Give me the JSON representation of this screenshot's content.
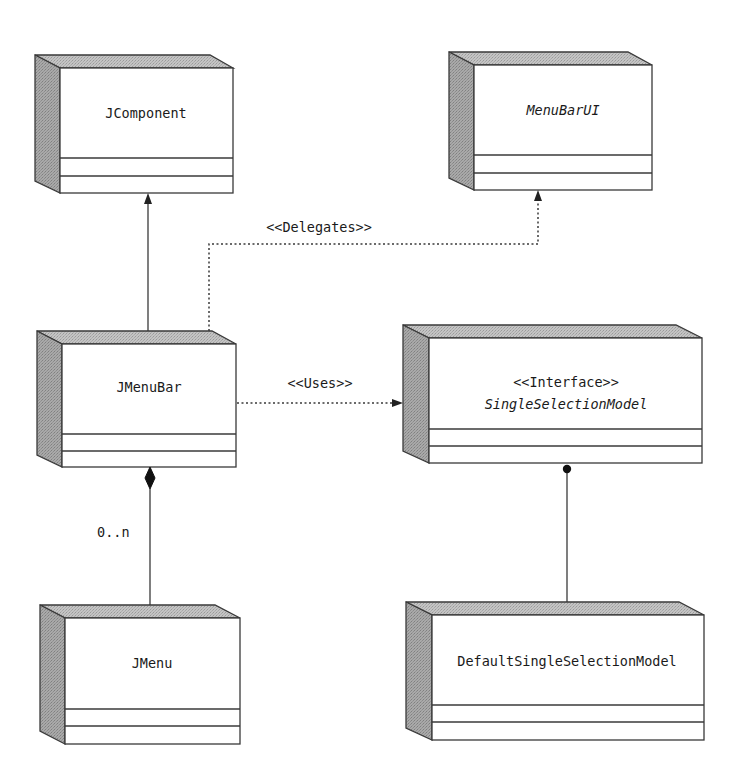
{
  "diagram": {
    "type": "UML class diagram",
    "colors": {
      "stroke": "#3a3a3a",
      "front_face": "#ffffff",
      "side_face": "#b8b8b8",
      "top_face": "#c8c8c8",
      "text": "#1a1a1a"
    },
    "classes": {
      "jcomponent": {
        "name": "JComponent",
        "italic": false
      },
      "menubarui": {
        "name": "MenuBarUI",
        "italic": true
      },
      "jmenubar": {
        "name": "JMenuBar",
        "italic": false
      },
      "singleselectionmodel": {
        "stereotype": "<<Interface>>",
        "name": "SingleSelectionModel",
        "italic": true
      },
      "jmenu": {
        "name": "JMenu",
        "italic": false
      },
      "defaultsingleselectionmodel": {
        "name": "DefaultSingleSelectionModel",
        "italic": false
      }
    },
    "relations": {
      "inherits": {
        "from": "JMenuBar",
        "to": "JComponent",
        "style": "solid-arrow"
      },
      "delegates": {
        "label": "<<Delegates>>",
        "from": "JMenuBar",
        "to": "MenuBarUI",
        "style": "dotted-arrow"
      },
      "uses": {
        "label": "<<Uses>>",
        "from": "JMenuBar",
        "to": "SingleSelectionModel",
        "style": "dotted-arrow"
      },
      "composition": {
        "label": "0..n",
        "from": "JMenuBar",
        "to": "JMenu",
        "style": "filled-diamond"
      },
      "implements": {
        "from": "DefaultSingleSelectionModel",
        "to": "SingleSelectionModel",
        "style": "lollipop"
      }
    }
  }
}
